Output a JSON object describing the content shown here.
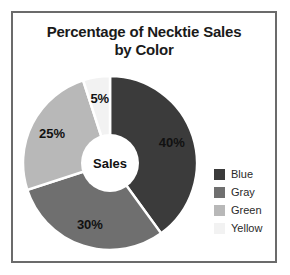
{
  "frame": {
    "border_color": "#6b6b6b",
    "background": "#ffffff"
  },
  "title": {
    "line1": "Percentage of Necktie Sales",
    "line2": "by Color"
  },
  "center_label": "Sales",
  "legend": {
    "items": [
      {
        "label": "Blue",
        "color": "#3b3b3b"
      },
      {
        "label": "Gray",
        "color": "#6f6f6f"
      },
      {
        "label": "Green",
        "color": "#b8b8b8"
      },
      {
        "label": "Yellow",
        "color": "#f2f2f2"
      }
    ]
  },
  "chart_data": {
    "type": "pie",
    "variant": "donut",
    "title": "Percentage of Necktie Sales by Color",
    "subtitle": "",
    "xlabel": "",
    "ylabel": "",
    "center_text": "Sales",
    "start_angle_deg": 0,
    "direction": "clockwise",
    "inner_radius_ratio": 0.35,
    "legend_position": "right",
    "grid": false,
    "value_unit": "%",
    "categories": [
      "Blue",
      "Gray",
      "Green",
      "Yellow"
    ],
    "values": [
      40,
      30,
      25,
      5
    ],
    "data_labels": [
      "40%",
      "30%",
      "25%",
      "5%"
    ],
    "colors": [
      "#3b3b3b",
      "#6f6f6f",
      "#b8b8b8",
      "#f2f2f2"
    ],
    "slices": [
      {
        "name": "Blue",
        "value": 40,
        "label": "40%",
        "color": "#3b3b3b"
      },
      {
        "name": "Gray",
        "value": 30,
        "label": "30%",
        "color": "#6f6f6f"
      },
      {
        "name": "Green",
        "value": 25,
        "label": "25%",
        "color": "#b8b8b8"
      },
      {
        "name": "Yellow",
        "value": 5,
        "label": "5%",
        "color": "#f2f2f2"
      }
    ]
  }
}
